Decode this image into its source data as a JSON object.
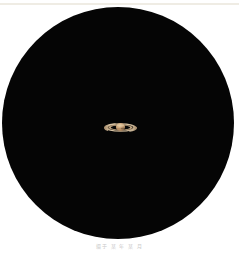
{
  "page": {
    "background_color": "#ffffff",
    "width": 239,
    "height": 253
  },
  "top_rule": {
    "name": "top-divider",
    "color": "#efece4"
  },
  "field_of_view": {
    "label": "telescope-eyepiece-field",
    "color": "#050505",
    "shape": "circle",
    "diameter_px": 232
  },
  "subject": {
    "name": "Saturn",
    "body_color": "#caa177",
    "body_highlight_color": "#e0c49c",
    "body_shadow_color": "#9a7550",
    "ring_color": "#d8c4a6",
    "ring_outer_color": "#b59a78",
    "ring_gap_color": "#1a1614",
    "ring_span_px": 33,
    "disc_diameter_px": 15
  },
  "caption": {
    "text": "摄于 某 年 某 月",
    "color": "#c9c9c9"
  }
}
